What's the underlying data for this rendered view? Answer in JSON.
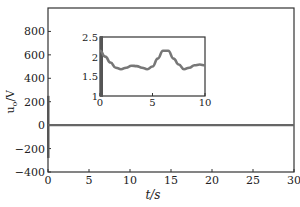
{
  "chart_data": [
    {
      "type": "line",
      "title": "",
      "xlabel": "t/s",
      "ylabel": "u_o/V",
      "xlim": [
        0,
        30
      ],
      "ylim": [
        -400,
        1000
      ],
      "xticks": [
        "0",
        "5",
        "10",
        "15",
        "20",
        "25",
        "30"
      ],
      "yticks": [
        "-400",
        "-200",
        "0",
        "200",
        "400",
        "600",
        "800"
      ],
      "grid": false,
      "legend": null,
      "series": [
        {
          "name": "u_o",
          "description": "Startup transient spike between about -280 and +250 at t≈0, then settles near 2 V",
          "x": [
            0,
            0.05,
            0.1,
            0.2,
            0.5,
            1,
            5,
            10,
            15,
            20,
            25,
            30
          ],
          "values": [
            250,
            -280,
            150,
            2.1,
            2.0,
            1.9,
            2.0,
            1.8,
            2.0,
            1.9,
            2.0,
            1.9
          ]
        }
      ]
    },
    {
      "type": "line",
      "title": "inset (zoom)",
      "xlabel": "",
      "ylabel": "",
      "xlim": [
        0,
        10
      ],
      "ylim": [
        1,
        2.5
      ],
      "xticks": [
        "0",
        "5",
        "10"
      ],
      "yticks": [
        "1",
        "1.5",
        "2",
        "2.5"
      ],
      "grid": false,
      "series": [
        {
          "name": "u_o (inset)",
          "x": [
            0,
            0.5,
            1,
            1.5,
            2,
            2.5,
            3,
            3.5,
            4,
            4.5,
            5,
            5.5,
            6,
            6.5,
            7,
            7.5,
            8,
            8.5,
            9,
            9.5,
            10
          ],
          "values": [
            2.15,
            2.0,
            1.85,
            1.72,
            1.68,
            1.72,
            1.77,
            1.76,
            1.72,
            1.68,
            1.75,
            1.95,
            2.15,
            2.15,
            1.95,
            1.8,
            1.68,
            1.72,
            1.78,
            1.8,
            1.78
          ]
        }
      ]
    }
  ]
}
